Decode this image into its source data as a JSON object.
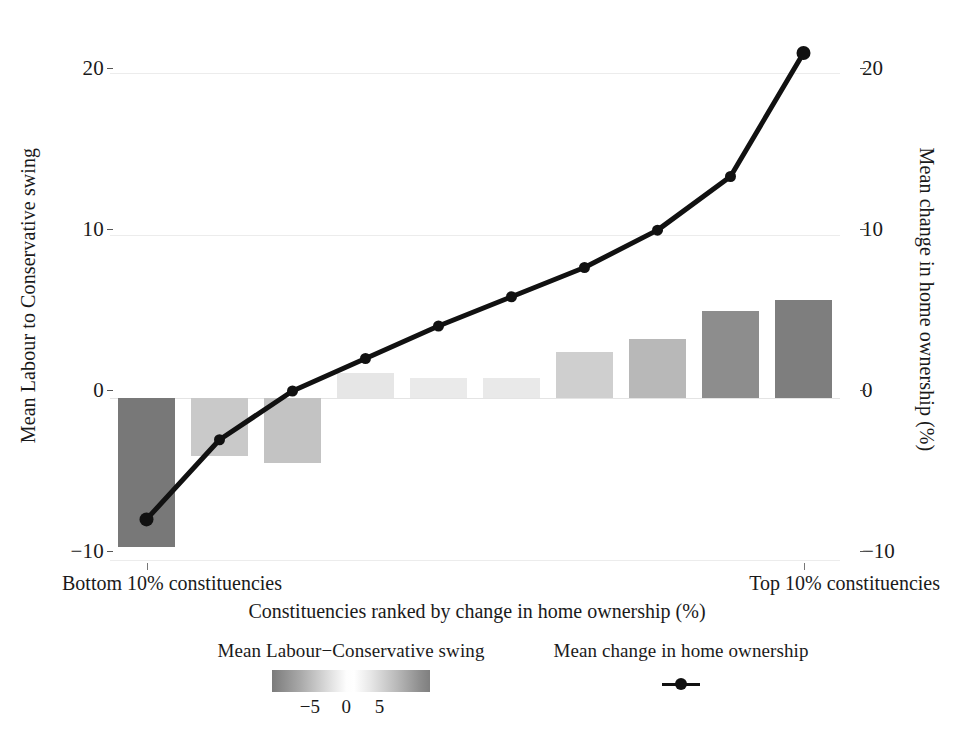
{
  "chart_data": {
    "type": "bar",
    "title": "",
    "xlabel": "Constituencies ranked by change in home ownership (%)",
    "ylabel": "Mean Labour to Conservative swing",
    "y2label": "Mean change in home ownership (%)",
    "categories": [
      "1",
      "2",
      "3",
      "4",
      "5",
      "6",
      "7",
      "8",
      "9",
      "10"
    ],
    "x_tick_labels": [
      "Bottom 10% constituencies",
      "Top 10% constituencies"
    ],
    "ylim": [
      -10,
      22
    ],
    "y2lim": [
      -10,
      22
    ],
    "yticks": [
      20,
      10,
      0,
      -10
    ],
    "y2ticks": [
      20,
      10,
      0,
      -10
    ],
    "grid": true,
    "legend_position": "bottom",
    "series": [
      {
        "name": "Mean Labour-Conservative swing",
        "type": "bar",
        "values": [
          -9.2,
          -3.6,
          -4.0,
          1.5,
          1.2,
          1.2,
          2.8,
          3.6,
          5.3,
          6.0
        ],
        "fill_values": [
          -9.2,
          -3.6,
          -4.0,
          1.5,
          1.2,
          1.2,
          2.8,
          3.6,
          5.3,
          6.0
        ],
        "colors": [
          "#787878",
          "#c9c9c9",
          "#c3c3c3",
          "#e6e6e6",
          "#eaeaea",
          "#e9e9e9",
          "#cfcfcf",
          "#b8b8b8",
          "#8d8d8d",
          "#7e7e7e"
        ]
      },
      {
        "name": "Mean change in home ownership",
        "type": "line",
        "values": [
          -7.5,
          -2.6,
          0.4,
          2.4,
          4.4,
          6.2,
          8.0,
          10.3,
          13.6,
          21.2
        ],
        "color": "#111111"
      }
    ]
  },
  "axes": {
    "left_title": "Mean Labour to Conservative swing",
    "right_title": "Mean change in home ownership (%)",
    "x_title": "Constituencies ranked by change in home ownership (%)",
    "left_ticks": [
      "20",
      "10",
      "0",
      "−10"
    ],
    "right_ticks": [
      "20",
      "10",
      "0",
      "−10"
    ],
    "x_tick_left": "Bottom 10% constituencies",
    "x_tick_right": "Top 10% constituencies"
  },
  "legend": {
    "swing": {
      "title": "Mean Labour−Conservative swing",
      "ticks": [
        "−5",
        "0",
        "5"
      ],
      "gradient_low_color": "#7b7b7b",
      "gradient_mid_color": "#ffffff",
      "gradient_high_color": "#7f7f7f"
    },
    "line": {
      "title": "Mean change in home ownership",
      "marker_color": "#111111"
    }
  },
  "style": {
    "background": "#ffffff",
    "gridline_color": "#ececec",
    "text_color": "#1a1a1a",
    "line_color": "#111111"
  }
}
